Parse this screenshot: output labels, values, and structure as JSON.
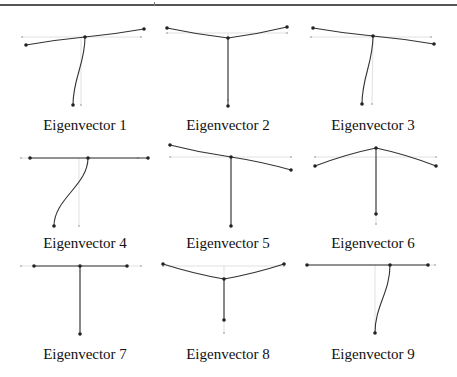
{
  "figure": {
    "captions": [
      "Eigenvector 1",
      "Eigenvector 2",
      "Eigenvector 3",
      "Eigenvector 4",
      "Eigenvector 5",
      "Eigenvector 6",
      "Eigenvector 7",
      "Eigenvector 8",
      "Eigenvector 9"
    ],
    "line_color": "#333333",
    "guide_color": "#cccccc",
    "panels": [
      {
        "label": "Eigenvector 1",
        "left": [
          26,
          45
        ],
        "center": [
          85,
          37
        ],
        "right": [
          144,
          29
        ],
        "bottom": [
          73,
          105
        ],
        "rest_center": [
          81,
          37
        ],
        "rest_left": [
          22,
          37
        ],
        "rest_right": [
          141,
          37
        ],
        "rest_bottom": [
          81,
          105
        ]
      },
      {
        "label": "Eigenvector 2",
        "left": [
          167,
          28
        ],
        "center": [
          228,
          38
        ],
        "right": [
          287,
          27
        ],
        "bottom": [
          228,
          106
        ],
        "rest_center": [
          228,
          33
        ],
        "rest_left": [
          167,
          33
        ],
        "rest_right": [
          287,
          33
        ],
        "rest_bottom": [
          228,
          100
        ]
      },
      {
        "label": "Eigenvector 3",
        "left": [
          313,
          28
        ],
        "center": [
          373,
          36
        ],
        "right": [
          434,
          44
        ],
        "bottom": [
          362,
          104
        ],
        "rest_center": [
          373,
          37
        ],
        "rest_left": [
          311,
          37
        ],
        "rest_right": [
          431,
          37
        ],
        "rest_bottom": [
          372,
          104
        ]
      },
      {
        "label": "Eigenvector 4",
        "left": [
          30,
          158
        ],
        "center": [
          88,
          158
        ],
        "right": [
          148,
          158
        ],
        "bottom": [
          54,
          226
        ],
        "rest_center": [
          79,
          158
        ],
        "rest_left": [
          21,
          158
        ],
        "rest_right": [
          138,
          158
        ],
        "rest_bottom": [
          79,
          226
        ]
      },
      {
        "label": "Eigenvector 5",
        "left": [
          170,
          145
        ],
        "center": [
          231,
          157
        ],
        "right": [
          291,
          170
        ],
        "bottom": [
          231,
          226
        ],
        "rest_center": [
          231,
          157
        ],
        "rest_left": [
          170,
          157
        ],
        "rest_right": [
          291,
          157
        ],
        "rest_bottom": [
          231,
          226
        ]
      },
      {
        "label": "Eigenvector 6",
        "left": [
          315,
          166
        ],
        "center": [
          376,
          148
        ],
        "right": [
          436,
          166
        ],
        "bottom": [
          376,
          214
        ],
        "rest_center": [
          376,
          157
        ],
        "rest_left": [
          315,
          157
        ],
        "rest_right": [
          436,
          157
        ],
        "rest_bottom": [
          376,
          224
        ]
      },
      {
        "label": "Eigenvector 7",
        "left": [
          34,
          266
        ],
        "center": [
          80,
          266
        ],
        "right": [
          127,
          266
        ],
        "bottom": [
          80,
          334
        ],
        "rest_center": [
          80,
          266
        ],
        "rest_left": [
          21,
          266
        ],
        "rest_right": [
          141,
          266
        ],
        "rest_bottom": [
          80,
          334
        ]
      },
      {
        "label": "Eigenvector 8",
        "left": [
          163,
          264
        ],
        "center": [
          224,
          279
        ],
        "right": [
          284,
          264
        ],
        "bottom": [
          224,
          320
        ],
        "rest_center": [
          224,
          266
        ],
        "rest_left": [
          163,
          266
        ],
        "rest_right": [
          284,
          266
        ],
        "rest_bottom": [
          224,
          333
        ]
      },
      {
        "label": "Eigenvector 9",
        "left": [
          307,
          265
        ],
        "center": [
          390,
          265
        ],
        "right": [
          428,
          265
        ],
        "bottom": [
          375,
          333
        ],
        "rest_center": [
          375,
          265
        ],
        "rest_left": [
          307,
          265
        ],
        "rest_right": [
          435,
          265
        ],
        "rest_bottom": [
          375,
          333
        ]
      }
    ]
  }
}
